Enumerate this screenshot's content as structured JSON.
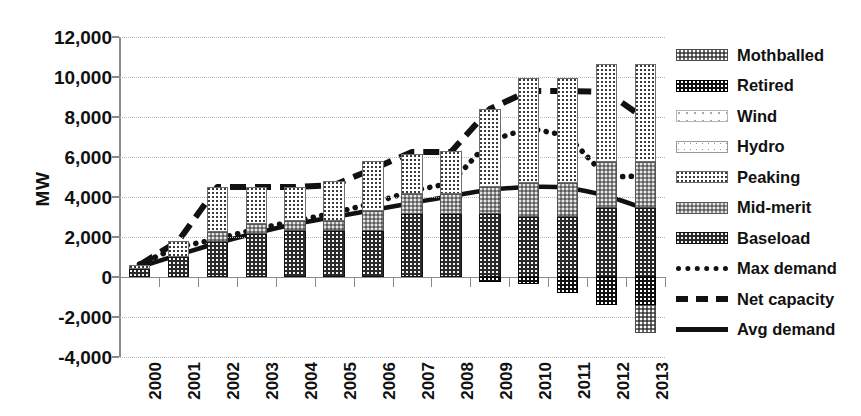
{
  "chart_data": {
    "type": "bar",
    "title": "",
    "xlabel": "",
    "ylabel": "MW",
    "ylim": [
      -4000,
      12000
    ],
    "ytick_labels": [
      "12,000",
      "10,000",
      "8,000",
      "6,000",
      "4,000",
      "2,000",
      "0",
      "-2,000",
      "-4,000"
    ],
    "ytick_values": [
      12000,
      10000,
      8000,
      6000,
      4000,
      2000,
      0,
      -2000,
      -4000
    ],
    "grid": true,
    "legend_position": "right",
    "categories": [
      "2000",
      "2001",
      "2002",
      "2003",
      "2004",
      "2005",
      "2006",
      "2007",
      "2008",
      "2009",
      "2010",
      "2011",
      "2012",
      "2013"
    ],
    "stacked": true,
    "series": [
      {
        "name": "Baseload",
        "type": "bar",
        "pattern": "dark-checker",
        "values": [
          400,
          1000,
          1750,
          2150,
          2300,
          2300,
          2300,
          3150,
          3150,
          3150,
          3000,
          3000,
          3450,
          3450
        ]
      },
      {
        "name": "Mid-merit",
        "type": "bar",
        "pattern": "medium-gray",
        "values": [
          0,
          0,
          500,
          500,
          500,
          500,
          1000,
          1000,
          1000,
          1350,
          1700,
          1700,
          2300,
          2300
        ]
      },
      {
        "name": "Peaking",
        "type": "bar",
        "pattern": "light-dotted",
        "values": [
          200,
          800,
          2250,
          1850,
          1700,
          2000,
          2500,
          2000,
          2150,
          3900,
          5250,
          5250,
          4900,
          4900
        ]
      },
      {
        "name": "Hydro",
        "type": "bar",
        "pattern": "very-light-dotted",
        "values": [
          0,
          0,
          0,
          0,
          0,
          0,
          0,
          0,
          0,
          0,
          0,
          0,
          0,
          0
        ]
      },
      {
        "name": "Wind",
        "type": "bar",
        "pattern": "sparse-dots",
        "values": [
          0,
          0,
          0,
          0,
          0,
          0,
          0,
          0,
          0,
          0,
          0,
          0,
          0,
          0
        ]
      },
      {
        "name": "Retired",
        "type": "bar",
        "pattern": "black-checker",
        "values": [
          0,
          0,
          0,
          0,
          0,
          0,
          0,
          0,
          0,
          -250,
          -350,
          -800,
          -1400,
          -1400
        ]
      },
      {
        "name": "Mothballed",
        "type": "bar",
        "pattern": "gray-checker",
        "values": [
          0,
          0,
          0,
          0,
          0,
          0,
          0,
          0,
          0,
          0,
          0,
          0,
          0,
          -1400
        ]
      },
      {
        "name": "Max demand",
        "type": "line",
        "style": "dotted",
        "values": [
          650,
          1500,
          1900,
          2400,
          2800,
          3200,
          3700,
          4300,
          4700,
          6800,
          7450,
          7050,
          5000,
          5050
        ]
      },
      {
        "name": "Net capacity",
        "type": "line",
        "style": "dashed",
        "values": [
          600,
          1800,
          4500,
          4500,
          4500,
          4600,
          5400,
          6250,
          6250,
          8400,
          9300,
          9300,
          9250,
          7900
        ]
      },
      {
        "name": "Avg demand",
        "type": "line",
        "style": "solid",
        "values": [
          500,
          1100,
          1700,
          2200,
          2650,
          3000,
          3350,
          3700,
          4050,
          4350,
          4500,
          4450,
          4050,
          3400
        ]
      }
    ]
  },
  "legend": {
    "items": [
      {
        "label": "Mothballed",
        "kind": "swatch",
        "pattern": "gray-checker"
      },
      {
        "label": "Retired",
        "kind": "swatch",
        "pattern": "black-checker"
      },
      {
        "label": "Wind",
        "kind": "swatch",
        "pattern": "sparse-dots"
      },
      {
        "label": "Hydro",
        "kind": "swatch",
        "pattern": "very-light-dotted"
      },
      {
        "label": "Peaking",
        "kind": "swatch",
        "pattern": "light-dotted"
      },
      {
        "label": "Mid-merit",
        "kind": "swatch",
        "pattern": "medium-gray"
      },
      {
        "label": "Baseload",
        "kind": "swatch",
        "pattern": "dark-checker"
      },
      {
        "label": "Max demand",
        "kind": "line",
        "style": "dotted"
      },
      {
        "label": "Net capacity",
        "kind": "line",
        "style": "dashed"
      },
      {
        "label": "Avg demand",
        "kind": "line",
        "style": "solid"
      }
    ]
  },
  "colors": {
    "axis": "#8a8a8a",
    "grid": "#b9b9b9",
    "text": "#111111",
    "baseload": "#2a2a2a",
    "midmerit": "#8d8d8d",
    "peaking": "#ffffff",
    "retired": "#111111",
    "mothballed": "#6f6f6f"
  }
}
